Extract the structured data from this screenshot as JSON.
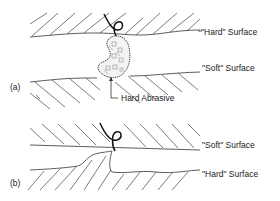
{
  "diagram": {
    "panel_a": {
      "tag": "(a)",
      "top_surface_label": "\"Hard\" Surface",
      "bottom_surface_label": "\"Soft\" Surface",
      "particle_label": "Hard Abrasive"
    },
    "panel_b": {
      "tag": "(b)",
      "top_surface_label": "\"Soft\" Surface",
      "bottom_surface_label": "\"Hard\" Surface"
    },
    "colors": {
      "line": "#333333",
      "background": "#ffffff"
    }
  }
}
